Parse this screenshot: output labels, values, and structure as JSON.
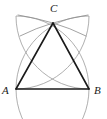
{
  "figure": {
    "type": "geometry-construction",
    "width": 107,
    "height": 119,
    "background_color": "#ffffff",
    "labels": {
      "a": "A",
      "b": "B",
      "c": "C"
    },
    "colors": {
      "triangle_stroke": "#1a1a1a",
      "arc_stroke": "#9a9a9a",
      "construction_arc_stroke": "#8c8c8c",
      "label_color": "#1a1a1a"
    },
    "stroke_widths": {
      "triangle": 1.6,
      "arc": 0.8,
      "construction_arc": 0.8
    },
    "points": {
      "a": {
        "x": 16,
        "y": 89
      },
      "b": {
        "x": 89,
        "y": 89
      },
      "c": {
        "x": 53,
        "y": 23
      }
    },
    "segments": [
      {
        "name": "AB",
        "from": "a",
        "to": "b"
      },
      {
        "name": "AC",
        "from": "a",
        "to": "c"
      },
      {
        "name": "BC",
        "from": "b",
        "to": "c"
      }
    ],
    "arcs": [
      {
        "name": "circle-centered-at-A",
        "center": {
          "x": 16,
          "y": 89
        },
        "radius": 73,
        "path": "M 89 89 A 73 73 0 0 1 16 16 A 73 73 0 0 1 16 162"
      },
      {
        "name": "circle-centered-at-B",
        "center": {
          "x": 89,
          "y": 89
        },
        "radius": 73,
        "path": "M 16 89 A 73 73 0 0 0 89 16 A 73 73 0 0 0 89 162"
      },
      {
        "name": "construction-arc-left",
        "path": "M 18 15 Q 36 18 53 23 Q 70 28 86 36"
      },
      {
        "name": "construction-arc-right",
        "path": "M 88 15 Q 70 18 53 23 Q 36 28 20 36"
      }
    ]
  }
}
